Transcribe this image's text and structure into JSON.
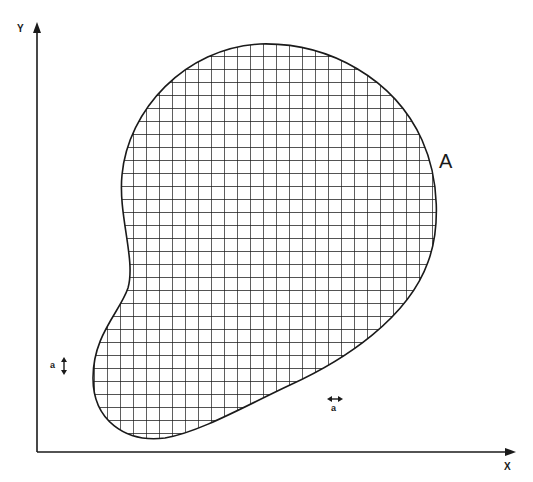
{
  "diagram": {
    "axes": {
      "x_label": "X",
      "y_label": "Y"
    },
    "region": {
      "label": "A",
      "fill_pattern": "square grid",
      "grid_cell_px": 13
    },
    "unit_markers": {
      "vertical": {
        "label": "a",
        "arrow": "↕"
      },
      "horizontal": {
        "label": "a",
        "arrow": "↔"
      }
    },
    "colors": {
      "stroke": "#1a1a1a",
      "background": "#ffffff"
    }
  }
}
